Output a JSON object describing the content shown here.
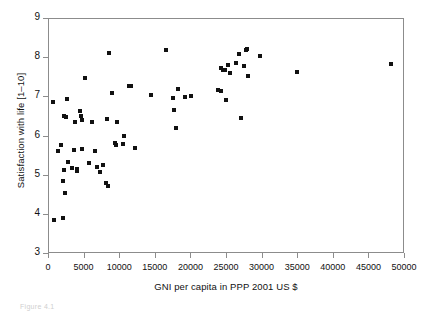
{
  "figure": {
    "caption_fragment": "Figure 4.1",
    "background": "#ffffff",
    "marker_color": "#111111",
    "axis_color": "#8c8c8c"
  },
  "chart_data": {
    "type": "scatter",
    "title": "",
    "xlabel": "GNI per capita in PPP 2001 US $",
    "ylabel": "Satisfaction with life [1–10]",
    "xlim": [
      0,
      50000
    ],
    "ylim": [
      3,
      9
    ],
    "xticks": [
      0,
      5000,
      10000,
      15000,
      20000,
      25000,
      30000,
      35000,
      40000,
      45000,
      50000
    ],
    "xticklabels": [
      "0",
      "5000",
      "10000",
      "15000",
      "20000",
      "25000",
      "30000",
      "35000",
      "40000",
      "45000",
      "50000"
    ],
    "yticks": [
      3,
      4,
      5,
      6,
      7,
      8,
      9
    ],
    "yticklabels": [
      "3",
      "4",
      "5",
      "6",
      "7",
      "8",
      "9"
    ],
    "grid": false,
    "legend": null,
    "marker": "square",
    "series": [
      {
        "name": "Countries",
        "points": [
          [
            600,
            6.88
          ],
          [
            750,
            3.86
          ],
          [
            1300,
            5.63
          ],
          [
            1700,
            5.78
          ],
          [
            1900,
            4.87
          ],
          [
            2000,
            3.93
          ],
          [
            2050,
            6.52
          ],
          [
            2150,
            5.14
          ],
          [
            2200,
            4.57
          ],
          [
            2400,
            6.5
          ],
          [
            2500,
            6.96
          ],
          [
            2650,
            5.35
          ],
          [
            3300,
            5.19
          ],
          [
            3500,
            5.66
          ],
          [
            3700,
            6.38
          ],
          [
            3900,
            5.16
          ],
          [
            4000,
            5.11
          ],
          [
            4300,
            6.66
          ],
          [
            4500,
            6.53
          ],
          [
            4600,
            6.43
          ],
          [
            4700,
            5.67
          ],
          [
            5000,
            7.5
          ],
          [
            5600,
            5.33
          ],
          [
            6100,
            6.37
          ],
          [
            6400,
            5.62
          ],
          [
            6800,
            5.23
          ],
          [
            7200,
            5.1
          ],
          [
            7600,
            5.26
          ],
          [
            8000,
            4.82
          ],
          [
            8200,
            6.45
          ],
          [
            8300,
            4.74
          ],
          [
            8400,
            8.12
          ],
          [
            8900,
            7.11
          ],
          [
            9200,
            5.84
          ],
          [
            9400,
            5.78
          ],
          [
            9600,
            6.37
          ],
          [
            10600,
            6.02
          ],
          [
            10400,
            5.8
          ],
          [
            11300,
            7.28
          ],
          [
            11500,
            7.3
          ],
          [
            12100,
            5.7
          ],
          [
            14300,
            7.05
          ],
          [
            16500,
            8.2
          ],
          [
            17400,
            6.99
          ],
          [
            17600,
            6.67
          ],
          [
            17900,
            6.21
          ],
          [
            18100,
            7.22
          ],
          [
            19100,
            7.02
          ],
          [
            20000,
            7.04
          ],
          [
            23800,
            7.18
          ],
          [
            24100,
            7.15
          ],
          [
            24200,
            7.75
          ],
          [
            24400,
            7.69
          ],
          [
            24700,
            7.7
          ],
          [
            24900,
            6.92
          ],
          [
            25100,
            7.83
          ],
          [
            25400,
            7.62
          ],
          [
            26300,
            7.88
          ],
          [
            26700,
            8.1
          ],
          [
            27000,
            6.48
          ],
          [
            27400,
            7.8
          ],
          [
            27600,
            8.21
          ],
          [
            27800,
            8.23
          ],
          [
            27900,
            7.55
          ],
          [
            29700,
            8.05
          ],
          [
            34900,
            7.65
          ],
          [
            48100,
            7.85
          ]
        ]
      }
    ]
  }
}
